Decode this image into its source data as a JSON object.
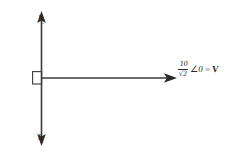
{
  "diagram": {
    "stroke_color": "#3a3a3a",
    "text_color": "#2b2b2b",
    "background": "#ffffff",
    "vertical_axis": {
      "up_label_main": "I",
      "up_label_sub": "C",
      "down_label_main": "I",
      "down_label_sub": "L"
    },
    "horizontal_axis": {
      "label_numerator": "10",
      "label_denominator": "√2",
      "label_angle": "∠0",
      "label_equals": "=",
      "label_symbol": "V"
    },
    "origin_marker": "right-angle-square"
  }
}
